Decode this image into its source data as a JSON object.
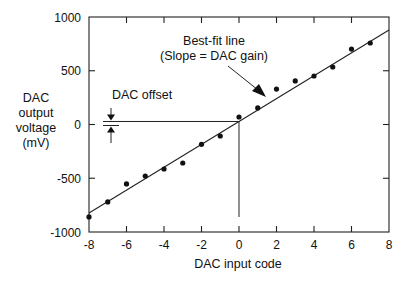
{
  "chart_data": {
    "type": "scatter",
    "title": "",
    "xlabel": "DAC input code",
    "ylabel_lines": [
      "DAC",
      "output",
      "voltage",
      "(mV)"
    ],
    "xlim": [
      -8,
      8
    ],
    "ylim": [
      -1000,
      1000
    ],
    "xticks": [
      -8,
      -6,
      -4,
      -2,
      0,
      2,
      4,
      6,
      8
    ],
    "xtick_labels": [
      "-8",
      "-6",
      "-4",
      "-2",
      "0",
      "2",
      "4",
      "6",
      "8"
    ],
    "yticks": [
      1000,
      500,
      0,
      -500,
      -1000
    ],
    "ytick_labels": [
      "1000",
      "500",
      "0",
      "-500",
      "-1000"
    ],
    "grid": false,
    "series": [
      {
        "name": "Measured output",
        "x": [
          -8,
          -7,
          -6,
          -5,
          -4,
          -3,
          -2,
          -1,
          0,
          1,
          2,
          3,
          4,
          5,
          6,
          7
        ],
        "y": [
          -860,
          -720,
          -553,
          -479,
          -414,
          -358,
          -184,
          -107,
          70,
          154,
          330,
          405,
          451,
          535,
          702,
          758
        ]
      }
    ],
    "best_fit": {
      "name": "Best-fit line",
      "slope": 106.4,
      "intercept": 28,
      "x_range": [
        -8,
        8
      ]
    },
    "annotations": {
      "best_fit_label_line1": "Best-fit line",
      "best_fit_label_line2": "(Slope = DAC gain)",
      "offset_label": "DAC offset",
      "offset_value": 28
    }
  }
}
